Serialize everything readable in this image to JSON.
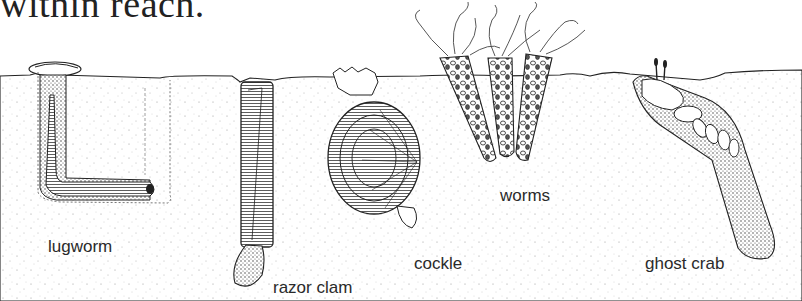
{
  "heading": {
    "text": "within reach."
  },
  "diagram": {
    "sand_color": "#f4f4f2",
    "ink_color": "#222222",
    "labels": [
      {
        "id": "lugworm",
        "text": "lugworm"
      },
      {
        "id": "razor-clam",
        "text": "razor clam"
      },
      {
        "id": "cockle",
        "text": "cockle"
      },
      {
        "id": "worms",
        "text": "worms"
      },
      {
        "id": "ghost-crab",
        "text": "ghost crab"
      }
    ]
  }
}
